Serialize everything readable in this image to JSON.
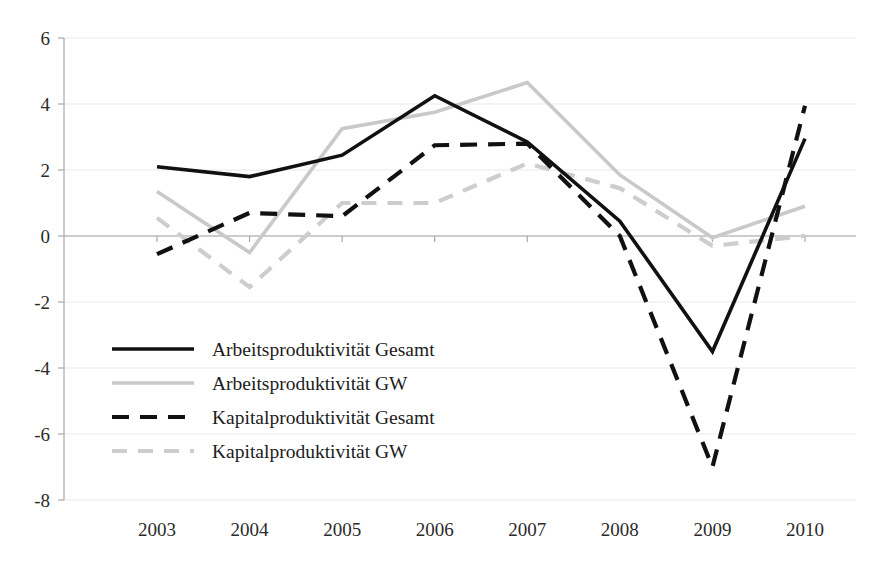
{
  "chart_data": {
    "type": "line",
    "title": "",
    "subtitle": "",
    "xlabel": "",
    "ylabel": "",
    "x": [
      "2003",
      "2004",
      "2005",
      "2006",
      "2007",
      "2008",
      "2009",
      "2010"
    ],
    "categories": [
      "2003",
      "2004",
      "2005",
      "2006",
      "2007",
      "2008",
      "2009",
      "2010"
    ],
    "xlim": [
      "2003",
      "2010"
    ],
    "ylim": [
      -8,
      6
    ],
    "yticks": [
      6,
      4,
      2,
      0,
      -2,
      -4,
      -6,
      -8
    ],
    "ytick_labels": [
      "6",
      "4",
      "2",
      "0",
      "-2",
      "-4",
      "-6",
      "-8"
    ],
    "xtick_labels": [
      "2003",
      "2004",
      "2005",
      "2006",
      "2007",
      "2008",
      "2009",
      "2010"
    ],
    "grid": true,
    "grid_axis": "y",
    "legend_position": "lower-left-inside",
    "series": [
      {
        "name": "Arbeitsproduktivität Gesamt",
        "values": [
          2.1,
          1.8,
          2.45,
          4.25,
          2.85,
          0.45,
          -3.5,
          2.95
        ],
        "color": "#111111",
        "style": "solid",
        "width": 3.6
      },
      {
        "name": "Arbeitsproduktivität GW",
        "values": [
          1.35,
          -0.5,
          3.25,
          3.75,
          4.65,
          1.85,
          -0.05,
          0.9
        ],
        "color": "#c9c9c9",
        "style": "solid",
        "width": 3.6
      },
      {
        "name": "Kapitalproduktivität Gesamt",
        "values": [
          -0.55,
          0.7,
          0.6,
          2.75,
          2.8,
          0.0,
          -7.0,
          3.95
        ],
        "color": "#111111",
        "style": "dashed",
        "width": 4.2
      },
      {
        "name": "Kapitalproduktivität GW",
        "values": [
          0.55,
          -1.55,
          1.0,
          1.0,
          2.2,
          1.45,
          -0.3,
          0.0
        ],
        "color": "#cdcdcd",
        "style": "dashed",
        "width": 4.2
      }
    ]
  },
  "legend": {
    "items": [
      {
        "label": "Arbeitsproduktivität Gesamt",
        "swatch": "solid-black"
      },
      {
        "label": "Arbeitsproduktivität GW",
        "swatch": "solid-gray"
      },
      {
        "label": "Kapitalproduktivität Gesamt",
        "swatch": "dashed-black"
      },
      {
        "label": "Kapitalproduktivität GW",
        "swatch": "dashed-gray"
      }
    ]
  },
  "colors": {
    "dark": "#111111",
    "light": "#c9c9c9",
    "grid": "#e9e9ec",
    "axis": "#a8a8a8",
    "text": "#2b2b2b",
    "background": "#ffffff"
  }
}
